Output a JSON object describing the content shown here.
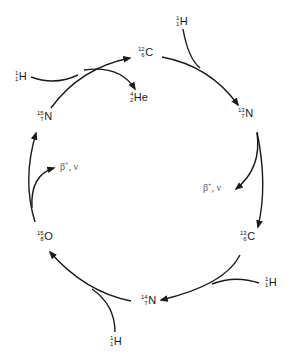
{
  "diagram": {
    "stroke_color": "#1a1a1a",
    "nuclides": [
      {
        "id": "c12",
        "mass": "12",
        "atomic": "6",
        "symbol": "C"
      },
      {
        "id": "n13",
        "mass": "13",
        "atomic": "7",
        "symbol": "N"
      },
      {
        "id": "c13",
        "mass": "13",
        "atomic": "6",
        "symbol": "C"
      },
      {
        "id": "n14",
        "mass": "14",
        "atomic": "7",
        "symbol": "N"
      },
      {
        "id": "o15",
        "mass": "15",
        "atomic": "8",
        "symbol": "O"
      },
      {
        "id": "n15",
        "mass": "15",
        "atomic": "7",
        "symbol": "N"
      },
      {
        "id": "he4",
        "mass": "4",
        "atomic": "2",
        "symbol": "He"
      },
      {
        "id": "h1_a",
        "mass": "1",
        "atomic": "1",
        "symbol": "H"
      },
      {
        "id": "h1_b",
        "mass": "1",
        "atomic": "1",
        "symbol": "H"
      },
      {
        "id": "h1_c",
        "mass": "1",
        "atomic": "1",
        "symbol": "H"
      },
      {
        "id": "h1_d",
        "mass": "1",
        "atomic": "1",
        "symbol": "H"
      }
    ],
    "emissions": [
      {
        "id": "beta_right",
        "particle": "β",
        "charge": "+",
        "neutrino": ", ν"
      },
      {
        "id": "beta_left",
        "particle": "β",
        "charge": "+",
        "neutrino": ", ν"
      }
    ]
  }
}
